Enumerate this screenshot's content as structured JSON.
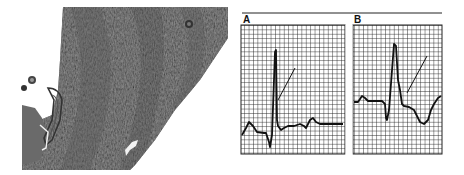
{
  "figure": {
    "left_panel": {
      "kind": "histology-micrograph",
      "description": "Grayscale stained tissue section (myocardial wall) with lumen on the left"
    },
    "right_panel": {
      "kind": "ecg-strips",
      "strips": [
        {
          "label": "A",
          "description": "ECG tracing with tall R wave; arrow points to ST segment"
        },
        {
          "label": "B",
          "description": "ECG tracing with tall R wave and depressed ST segment; arrow points to ST segment"
        }
      ]
    },
    "colors": {
      "background": "#ffffff",
      "tissue": "#6e6e6e",
      "grid": "#222222",
      "trace": "#111111"
    }
  }
}
